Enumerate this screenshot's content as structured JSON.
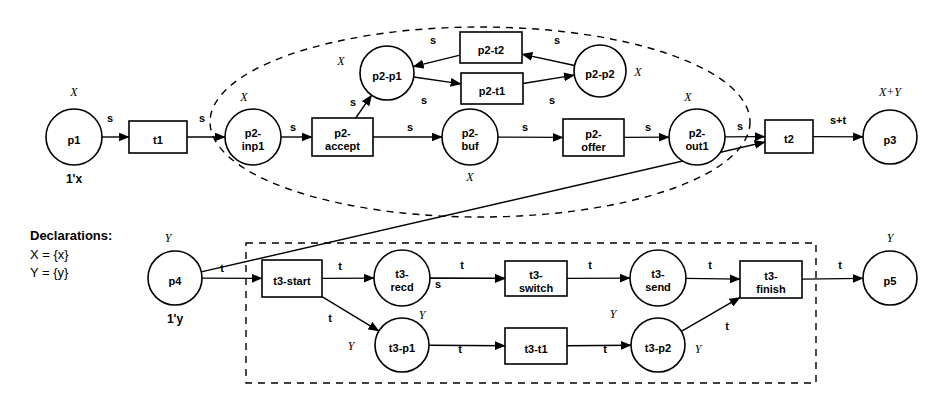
{
  "diagram": {
    "declarations": {
      "heading": "Declarations:",
      "lines": [
        "X = {x}",
        "Y = {y}"
      ]
    },
    "colors": {
      "stroke": "#000000",
      "background": "#ffffff"
    },
    "places": [
      {
        "id": "p1",
        "label": "p1",
        "cx": 74,
        "cy": 137,
        "r": 28,
        "type": "X",
        "type_x": 74,
        "type_y": 96,
        "init": "1'x",
        "init_x": 74,
        "init_y": 183
      },
      {
        "id": "p2-inp1",
        "label": "p2-\ninp1",
        "cx": 253,
        "cy": 137,
        "r": 28,
        "type": "X",
        "type_x": 244,
        "type_y": 101,
        "init": "",
        "init_x": 0,
        "init_y": 0
      },
      {
        "id": "p2-p1",
        "label": "p2-p1",
        "cx": 387,
        "cy": 73,
        "r": 27,
        "type": "X",
        "type_x": 341,
        "type_y": 65,
        "init": "",
        "init_x": 0,
        "init_y": 0
      },
      {
        "id": "p2-p2",
        "label": "p2-p2",
        "cx": 600,
        "cy": 71,
        "r": 26,
        "type": "X",
        "type_x": 638,
        "type_y": 76,
        "init": "",
        "init_x": 0,
        "init_y": 0
      },
      {
        "id": "p2-buf",
        "label": "p2-\nbuf",
        "cx": 470,
        "cy": 137,
        "r": 28,
        "type": "X",
        "type_x": 470,
        "type_y": 181,
        "init": "",
        "init_x": 0,
        "init_y": 0
      },
      {
        "id": "p2-out1",
        "label": "p2-\nout1",
        "cx": 697,
        "cy": 137,
        "r": 28,
        "type": "X",
        "type_x": 688,
        "type_y": 101,
        "init": "",
        "init_x": 0,
        "init_y": 0
      },
      {
        "id": "p3",
        "label": "p3",
        "cx": 890,
        "cy": 137,
        "r": 27,
        "type": "X+Y",
        "type_x": 890,
        "type_y": 96,
        "init": "",
        "init_x": 0,
        "init_y": 0
      },
      {
        "id": "p4",
        "label": "p4",
        "cx": 175,
        "cy": 278,
        "r": 27,
        "type": "Y",
        "type_x": 168,
        "type_y": 242,
        "init": "1'y",
        "init_x": 175,
        "init_y": 323
      },
      {
        "id": "t3-recd",
        "label": "t3-\nrecd",
        "cx": 402,
        "cy": 278,
        "r": 28,
        "type": "Y",
        "type_x": 422,
        "type_y": 319,
        "init": "",
        "init_x": 0,
        "init_y": 0
      },
      {
        "id": "t3-send",
        "label": "t3-\nsend",
        "cx": 658,
        "cy": 278,
        "r": 28,
        "type": "Y",
        "type_x": 613,
        "type_y": 318,
        "init": "",
        "init_x": 0,
        "init_y": 0
      },
      {
        "id": "p5",
        "label": "p5",
        "cx": 890,
        "cy": 278,
        "r": 27,
        "type": "Y",
        "type_x": 890,
        "type_y": 242,
        "init": "",
        "init_x": 0,
        "init_y": 0
      },
      {
        "id": "t3-p1",
        "label": "t3-p1",
        "cx": 402,
        "cy": 345,
        "r": 27,
        "type": "Y",
        "type_x": 351,
        "type_y": 350,
        "init": "",
        "init_x": 0,
        "init_y": 0
      },
      {
        "id": "t3-p2",
        "label": "t3-p2",
        "cx": 658,
        "cy": 345,
        "r": 27,
        "type": "Y",
        "type_x": 698,
        "type_y": 353,
        "init": "",
        "init_x": 0,
        "init_y": 0
      }
    ],
    "transitions": [
      {
        "id": "t1",
        "label": "t1",
        "x": 129,
        "y": 121,
        "w": 58,
        "h": 32
      },
      {
        "id": "p2-accept",
        "label": "p2-\naccept",
        "x": 312,
        "y": 118,
        "w": 61,
        "h": 38
      },
      {
        "id": "p2-t2",
        "label": "p2-t2",
        "x": 460,
        "y": 32,
        "w": 62,
        "h": 31
      },
      {
        "id": "p2-t1",
        "label": "p2-t1",
        "x": 461,
        "y": 73,
        "w": 62,
        "h": 31
      },
      {
        "id": "p2-offer",
        "label": "p2-\noffer",
        "x": 563,
        "y": 119,
        "w": 61,
        "h": 37
      },
      {
        "id": "t2",
        "label": "t2",
        "x": 765,
        "y": 120,
        "w": 48,
        "h": 33
      },
      {
        "id": "t3-start",
        "label": "t3-start",
        "x": 262,
        "y": 260,
        "w": 60,
        "h": 37
      },
      {
        "id": "t3-switch",
        "label": "t3-\nswitch",
        "x": 505,
        "y": 261,
        "w": 62,
        "h": 35
      },
      {
        "id": "t3-finish",
        "label": "t3-\nfinish",
        "x": 740,
        "y": 261,
        "w": 62,
        "h": 37
      },
      {
        "id": "t3-t1",
        "label": "t3-t1",
        "x": 505,
        "y": 328,
        "w": 62,
        "h": 36
      }
    ],
    "arcs": [
      {
        "from": "p1",
        "to": "t1",
        "label": "s",
        "lx": 110,
        "ly": 122
      },
      {
        "from": "t1",
        "to": "p2-inp1",
        "label": "s",
        "lx": 202,
        "ly": 122
      },
      {
        "from": "p2-inp1",
        "to": "p2-accept",
        "label": "s",
        "lx": 293,
        "ly": 131
      },
      {
        "from": "p2-accept",
        "to": "p2-p1",
        "label": "s",
        "lx": 353,
        "ly": 106
      },
      {
        "from": "p2-p1",
        "to": "p2-t1",
        "label": "s",
        "lx": 424,
        "ly": 104
      },
      {
        "from": "p2-t1",
        "to": "p2-p2",
        "label": "s",
        "lx": 552,
        "ly": 104
      },
      {
        "from": "p2-p2",
        "to": "p2-t2",
        "label": "s",
        "lx": 557,
        "ly": 44
      },
      {
        "from": "p2-t2",
        "to": "p2-p1",
        "label": "s",
        "lx": 433,
        "ly": 44
      },
      {
        "from": "p2-accept",
        "to": "p2-buf",
        "label": "s",
        "lx": 410,
        "ly": 131
      },
      {
        "from": "p2-buf",
        "to": "p2-offer",
        "label": "s",
        "lx": 525,
        "ly": 131
      },
      {
        "from": "p2-offer",
        "to": "p2-out1",
        "label": "s",
        "lx": 648,
        "ly": 131
      },
      {
        "from": "p2-out1",
        "to": "t2",
        "label": "s",
        "lx": 740,
        "ly": 130
      },
      {
        "from": "t2",
        "to": "p3",
        "label": "s+t",
        "lx": 838,
        "ly": 124
      },
      {
        "from": "p4",
        "to": "t3-start",
        "label": "t",
        "lx": 222,
        "ly": 272
      },
      {
        "from": "p4",
        "to": "t2",
        "label": "",
        "lx": 0,
        "ly": 0
      },
      {
        "from": "t3-start",
        "to": "t3-recd",
        "label": "t",
        "lx": 340,
        "ly": 270
      },
      {
        "from": "t3-start",
        "to": "t3-p1",
        "label": "t",
        "lx": 330,
        "ly": 322
      },
      {
        "from": "t3-recd",
        "to": "t3-switch",
        "label": "t",
        "lx": 462,
        "ly": 269
      },
      {
        "from": "t3-recd",
        "to": "t3-switch",
        "label": "s",
        "lx": 438,
        "ly": 288
      },
      {
        "from": "t3-switch",
        "to": "t3-send",
        "label": "t",
        "lx": 590,
        "ly": 269
      },
      {
        "from": "t3-send",
        "to": "t3-finish",
        "label": "t",
        "lx": 710,
        "ly": 269
      },
      {
        "from": "t3-p1",
        "to": "t3-t1",
        "label": "t",
        "lx": 460,
        "ly": 353
      },
      {
        "from": "t3-t1",
        "to": "t3-p2",
        "label": "t",
        "lx": 605,
        "ly": 353
      },
      {
        "from": "t3-p2",
        "to": "t3-finish",
        "label": "t",
        "lx": 727,
        "ly": 330
      },
      {
        "from": "t3-finish",
        "to": "p5",
        "label": "t",
        "lx": 840,
        "ly": 269
      }
    ],
    "regions": [
      {
        "id": "page-p2",
        "shape": "ellipse",
        "cx": 480,
        "cy": 122,
        "rx": 270,
        "ry": 95
      },
      {
        "id": "page-t3",
        "shape": "rect",
        "x": 246,
        "y": 243,
        "w": 570,
        "h": 140
      }
    ]
  }
}
